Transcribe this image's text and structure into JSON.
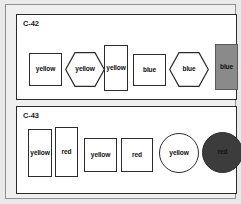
{
  "canvas": {
    "width": 241,
    "height": 204,
    "background": "#e9e9e9",
    "frame_border": "#8f8f8f"
  },
  "panels": [
    {
      "id": "c42",
      "label": "C-42",
      "shapes": [
        {
          "name": "rect-yellow-1",
          "type": "rectangle",
          "label": "yellow",
          "fill": "#ffffff",
          "stroke": "#2b2b2b",
          "x": 12,
          "y": 38,
          "w": 33,
          "h": 33
        },
        {
          "name": "hex-yellow-1",
          "type": "hexagon",
          "label": "yellow",
          "fill": "#ffffff",
          "stroke": "#2b2b2b",
          "x": 48,
          "y": 37,
          "w": 40,
          "h": 35
        },
        {
          "name": "rect-yellow-2",
          "type": "rectangle",
          "label": "yellow",
          "fill": "#ffffff",
          "stroke": "#2b2b2b",
          "x": 87,
          "y": 30,
          "w": 24,
          "h": 46
        },
        {
          "name": "rect-blue-1",
          "type": "rectangle",
          "label": "blue",
          "fill": "#ffffff",
          "stroke": "#2b2b2b",
          "x": 116,
          "y": 39,
          "w": 33,
          "h": 32
        },
        {
          "name": "hex-blue-1",
          "type": "hexagon",
          "label": "blue",
          "fill": "#ffffff",
          "stroke": "#2b2b2b",
          "x": 152,
          "y": 37,
          "w": 40,
          "h": 35
        },
        {
          "name": "rect-blue-filled",
          "type": "rectangle",
          "label": "blue",
          "fill": "#8a8a8a",
          "stroke": "#5a5a5a",
          "x": 198,
          "y": 29,
          "w": 23,
          "h": 46
        }
      ]
    },
    {
      "id": "c43",
      "label": "C-43",
      "shapes": [
        {
          "name": "rect-yellow-3",
          "type": "rectangle",
          "label": "yellow",
          "fill": "#ffffff",
          "stroke": "#2b2b2b",
          "x": 11,
          "y": 22,
          "w": 24,
          "h": 48
        },
        {
          "name": "rect-red-1",
          "type": "rectangle",
          "label": "red",
          "fill": "#ffffff",
          "stroke": "#2b2b2b",
          "x": 38,
          "y": 20,
          "w": 23,
          "h": 50
        },
        {
          "name": "rect-yellow-4",
          "type": "rectangle",
          "label": "yellow",
          "fill": "#ffffff",
          "stroke": "#2b2b2b",
          "x": 67,
          "y": 31,
          "w": 33,
          "h": 34
        },
        {
          "name": "rect-red-2",
          "type": "rectangle",
          "label": "red",
          "fill": "#ffffff",
          "stroke": "#2b2b2b",
          "x": 104,
          "y": 31,
          "w": 32,
          "h": 34
        },
        {
          "name": "circle-yellow-1",
          "type": "circle",
          "label": "yellow",
          "fill": "#ffffff",
          "stroke": "#2b2b2b",
          "x": 142,
          "y": 26,
          "w": 40,
          "h": 40
        },
        {
          "name": "circle-red-filled",
          "type": "circle",
          "label": "red",
          "fill": "#3c3c3c",
          "stroke": "#2b2b2b",
          "x": 185,
          "y": 25,
          "w": 41,
          "h": 41
        }
      ]
    }
  ]
}
